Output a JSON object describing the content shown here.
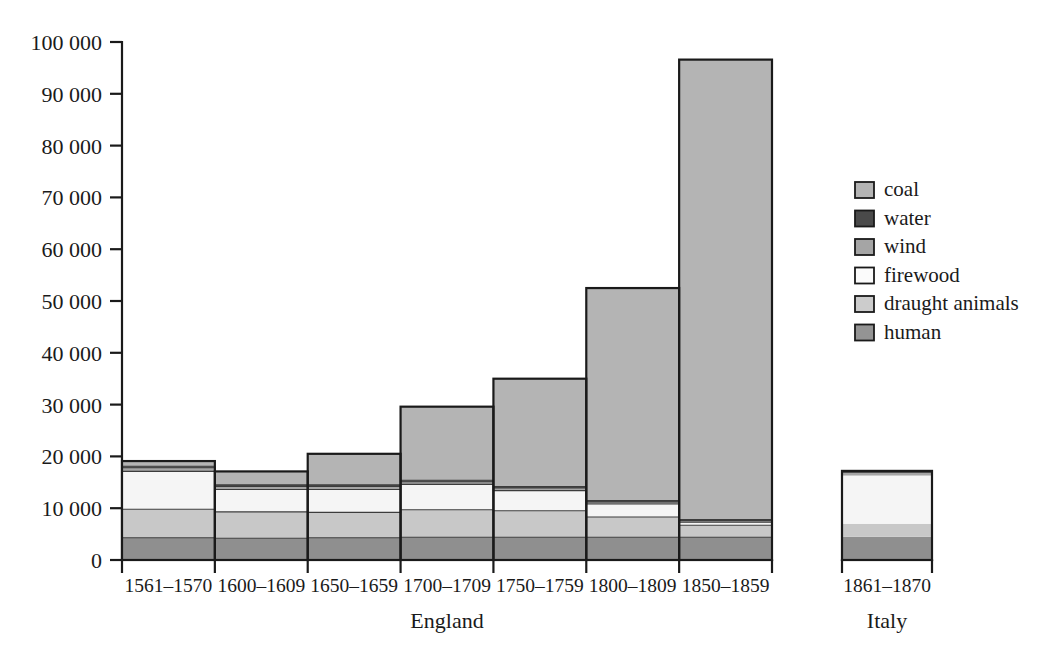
{
  "chart_data": {
    "type": "area",
    "title": "",
    "subtitle": "",
    "xlabel": "",
    "ylabel": "",
    "ylim": [
      0,
      100000
    ],
    "grid": false,
    "legend_position": "right",
    "ytick_labels": [
      "0",
      "10 000",
      "20 000",
      "30 000",
      "40 000",
      "50 000",
      "60 000",
      "70 000",
      "80 000",
      "90 000",
      "100 000"
    ],
    "ytick_values": [
      0,
      10000,
      20000,
      30000,
      40000,
      50000,
      60000,
      70000,
      80000,
      90000,
      100000
    ],
    "groups": [
      {
        "name": "England",
        "categories": [
          "1561–1570",
          "1600–1609",
          "1650–1659",
          "1700–1709",
          "1750–1759",
          "1800–1809",
          "1850–1859"
        ]
      },
      {
        "name": "Italy",
        "categories": [
          "1861–1870"
        ]
      }
    ],
    "series": [
      {
        "name": "human",
        "color": "#8f8f8f",
        "values": [
          4300,
          4200,
          4300,
          4400,
          4400,
          4400,
          4400,
          4500
        ]
      },
      {
        "name": "draught animals",
        "color": "#c8c8c8",
        "values": [
          5500,
          5100,
          4900,
          5300,
          5100,
          3900,
          2300,
          2500
        ]
      },
      {
        "name": "firewood",
        "color": "#f5f5f5",
        "values": [
          7300,
          4300,
          4400,
          4900,
          3900,
          2500,
          600,
          9300
        ]
      },
      {
        "name": "wind",
        "color": "#a5a5a5",
        "values": [
          700,
          600,
          600,
          500,
          500,
          400,
          300,
          500
        ]
      },
      {
        "name": "water",
        "color": "#4a4a4a",
        "values": [
          300,
          300,
          300,
          300,
          300,
          300,
          200,
          300
        ]
      },
      {
        "name": "coal",
        "color": "#b4b4b4",
        "values": [
          1000,
          2600,
          6000,
          14200,
          20800,
          41000,
          88800,
          100
        ]
      }
    ],
    "totals": [
      19100,
      17100,
      20500,
      29600,
      35000,
      52500,
      96600,
      17200
    ],
    "legend_entries": [
      {
        "label": "coal",
        "color": "#b4b4b4"
      },
      {
        "label": "water",
        "color": "#4a4a4a"
      },
      {
        "label": "wind",
        "color": "#a5a5a5"
      },
      {
        "label": "firewood",
        "color": "#fbfbfb"
      },
      {
        "label": "draught animals",
        "color": "#cccccc"
      },
      {
        "label": "human",
        "color": "#949494"
      }
    ]
  }
}
